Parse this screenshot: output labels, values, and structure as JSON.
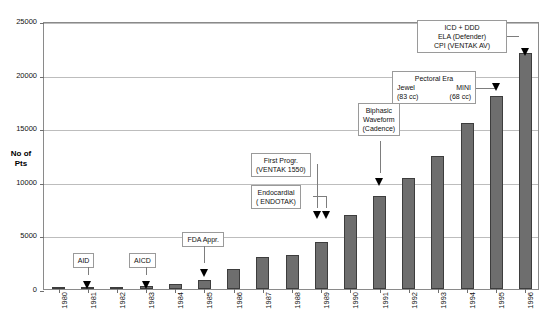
{
  "chart_data": {
    "type": "bar",
    "title": "",
    "xlabel": "",
    "ylabel": "No of Pts",
    "ylim": [
      0,
      25000
    ],
    "grid": true,
    "legend": "none",
    "y_ticks": [
      "0",
      "5000",
      "10000",
      "15000",
      "20000",
      "25000"
    ],
    "y_tick_values": [
      0,
      5000,
      10000,
      15000,
      20000,
      25000
    ],
    "categories": [
      "1980",
      "1981",
      "1982",
      "1983",
      "1984",
      "1985",
      "1986",
      "1987",
      "1988",
      "1989",
      "1990",
      "1991",
      "1992",
      "1993",
      "1994",
      "1995",
      "1996"
    ],
    "values": [
      60,
      80,
      120,
      300,
      450,
      800,
      1900,
      3000,
      3200,
      4400,
      6900,
      8700,
      10400,
      12400,
      15500,
      18000,
      22000
    ],
    "series_name": "No of Pts",
    "bar_color": "#6e6e6e",
    "bar_edge_color": "#3d3d3d",
    "grid_color": "#bdbdbd",
    "frame_color": "#8a8a8a",
    "annotations": [
      {
        "id": "aid",
        "lines": [
          "AID"
        ],
        "target_category": "1981",
        "style": "single"
      },
      {
        "id": "aicd",
        "lines": [
          "AICD"
        ],
        "target_category": "1983",
        "style": "single"
      },
      {
        "id": "fda-approval",
        "lines": [
          "FDA Appr."
        ],
        "target_category": "1985",
        "style": "single"
      },
      {
        "id": "first-programmable",
        "lines": [
          "First Progr.",
          "(VENTAK 1550)"
        ],
        "target_category": "1989",
        "style": "single"
      },
      {
        "id": "endocardial",
        "lines": [
          "Endocardial",
          "( ENDOTAK)"
        ],
        "target_category": "1989",
        "style": "single"
      },
      {
        "id": "biphasic-waveform",
        "lines": [
          "Biphasic",
          "Waveform",
          "(Cadence)"
        ],
        "target_category": "1991",
        "style": "single"
      },
      {
        "id": "pectoral-era",
        "lines": [
          "Pectoral Era",
          "Jewel",
          "MINI",
          "(83 cc)",
          "(68 cc)"
        ],
        "title": "Pectoral Era",
        "left_name": "Jewel",
        "right_name": "MINI",
        "left_size": "(83 cc)",
        "right_size": "(68 cc)",
        "target_category": "1995",
        "style": "two-column"
      },
      {
        "id": "icd-ddd",
        "lines": [
          "ICD + DDD",
          "ELA (Defender)",
          "CPI (VENTAK AV)"
        ],
        "target_category": "1996",
        "style": "single"
      }
    ]
  }
}
